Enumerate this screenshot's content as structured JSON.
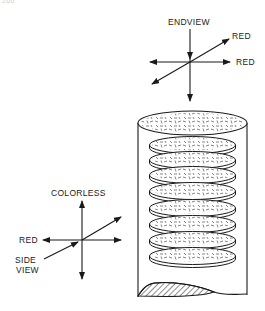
{
  "page_number": "266",
  "end_view": {
    "title": "ENDVIEW",
    "label_diagonal": "RED",
    "label_horizontal": "RED"
  },
  "side_view": {
    "label_top": "COLORLESS",
    "label_left": "RED",
    "label_view_line1": "SIDE",
    "label_view_line2": "VIEW"
  },
  "cylinder": {
    "disc_count": 8
  },
  "colors": {
    "line": "#1a1a1a",
    "background": "#ffffff"
  }
}
